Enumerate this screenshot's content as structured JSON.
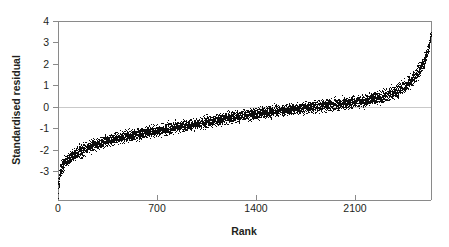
{
  "chart_data": {
    "type": "scatter",
    "title": "",
    "subtitle": "",
    "xlabel": "Rank",
    "ylabel": "Standardised residual",
    "xlim": [
      0,
      2640
    ],
    "ylim": [
      -3.5,
      4
    ],
    "xticks": [
      0,
      700,
      1400,
      2100
    ],
    "xticklabels": [
      "0",
      "700",
      "1400",
      "2100"
    ],
    "yticks": [
      -3,
      -2,
      -1,
      0,
      1,
      2,
      3,
      4
    ],
    "yticklabels": [
      "-3",
      "-2",
      "-1",
      "0",
      "1",
      "2",
      "3",
      "4"
    ],
    "grid": "horizontal-zero-line-only",
    "legend": "none",
    "point_color": "#0d0d0d",
    "n_points": 2640,
    "series": [
      {
        "name": "Standardised residual",
        "n": 2640,
        "band_center_profile": {
          "x": [
            0,
            15,
            40,
            80,
            150,
            250,
            400,
            600,
            800,
            1000,
            1250,
            1500,
            1750,
            2000,
            2200,
            2350,
            2450,
            2530,
            2590,
            2625,
            2640
          ],
          "y": [
            -3.05,
            -2.25,
            -1.95,
            -1.72,
            -1.45,
            -1.18,
            -0.92,
            -0.68,
            -0.48,
            -0.28,
            0.0,
            0.22,
            0.38,
            0.54,
            0.72,
            0.95,
            1.25,
            1.7,
            2.3,
            3.0,
            3.55
          ]
        },
        "band_halfwidth_profile": {
          "x": [
            0,
            15,
            40,
            150,
            400,
            1000,
            1600,
            2200,
            2450,
            2560,
            2620,
            2640
          ],
          "y": [
            0.42,
            0.38,
            0.34,
            0.32,
            0.3,
            0.3,
            0.3,
            0.32,
            0.36,
            0.34,
            0.25,
            0.12
          ]
        },
        "y_min": -3.45,
        "y_max": 3.72,
        "y_at_rank_0": -3.4,
        "y_at_rank_700": -0.8,
        "y_at_rank_1400": 0.3,
        "y_at_rank_2100": 0.65,
        "zero_crossing_rank": 1250
      }
    ]
  },
  "axes": {
    "y_axis_title": "Standardised residual",
    "x_axis_title": "Rank",
    "y_tick_labels": [
      "4",
      "3",
      "2",
      "1",
      "0",
      "-1",
      "-2",
      "-3"
    ],
    "x_tick_labels": [
      "0",
      "700",
      "1400",
      "2100"
    ]
  }
}
